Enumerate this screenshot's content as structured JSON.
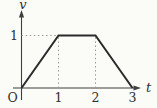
{
  "chart_data": {
    "type": "line",
    "title": "",
    "xlabel": "t",
    "ylabel": "v",
    "origin_label": "O",
    "x": [
      0,
      1,
      2,
      3
    ],
    "y": [
      0,
      1,
      1,
      0
    ],
    "x_ticks": [
      1,
      2,
      3
    ],
    "x_tick_labels": [
      "1",
      "2",
      "3"
    ],
    "y_ticks": [
      1
    ],
    "y_tick_labels": [
      "1"
    ],
    "xlim": [
      0,
      3.3
    ],
    "ylim": [
      0,
      1.45
    ],
    "grid": "off",
    "legend": "none",
    "guides": [
      {
        "x1": 0,
        "y1": 1,
        "x2": 1,
        "y2": 1
      },
      {
        "x1": 1,
        "y1": 0,
        "x2": 1,
        "y2": 1
      },
      {
        "x1": 2,
        "y1": 0,
        "x2": 2,
        "y2": 1
      }
    ],
    "colors": {
      "line": "#2b2b2b",
      "axis": "#3f3f3f",
      "guide": "#9a9a9a",
      "text": "#2f2f2f",
      "background": "#fbfbf8"
    }
  }
}
